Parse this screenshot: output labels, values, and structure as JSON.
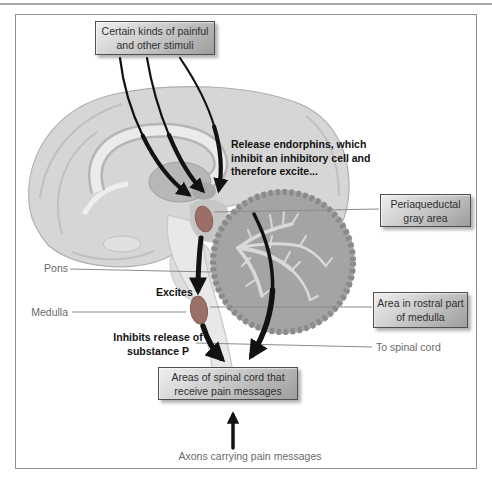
{
  "boxes": {
    "stimuli": {
      "lines": [
        "Certain kinds of painful",
        "and other stimuli"
      ]
    },
    "periaqueductal": {
      "lines": [
        "Periaqueductal",
        "gray area"
      ]
    },
    "rostral_medulla": {
      "lines": [
        "Area in rostral part",
        "of medulla"
      ]
    },
    "spinal_cord": {
      "lines": [
        "Areas of spinal cord that",
        "receive pain messages"
      ]
    }
  },
  "annotations": {
    "release_endorphins": {
      "lines": [
        "Release endorphins, which",
        "inhibit an inhibitory cell and",
        "therefore excite..."
      ]
    },
    "excites": "Excites",
    "inhibits": {
      "lines": [
        "Inhibits release of",
        "substance P"
      ]
    }
  },
  "labels": {
    "pons": "Pons",
    "medulla": "Medulla",
    "to_spinal_cord": "To spinal cord",
    "axons": "Axons carrying pain messages"
  },
  "colors": {
    "nucleus_highlight": "#9b6f66",
    "arrow": "#121212",
    "leader_line": "#8c8c8c",
    "box_border": "#4f4f4f",
    "label_text": "#6a6a6a"
  }
}
